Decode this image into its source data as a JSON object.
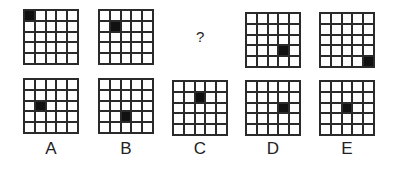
{
  "puzzle": {
    "grid_size": 5,
    "colors": {
      "line": "#2a2a2a",
      "filled": "#111111",
      "empty": "#ffffff"
    },
    "sequence": [
      {
        "id": "seq-1",
        "filled": [
          0,
          0
        ],
        "left": 23,
        "top": 9
      },
      {
        "id": "seq-2",
        "filled": [
          1,
          1
        ],
        "left": 98,
        "top": 9
      },
      {
        "id": "seq-3",
        "question": "?"
      },
      {
        "id": "seq-4",
        "filled": [
          3,
          3
        ],
        "left": 245,
        "top": 12
      },
      {
        "id": "seq-5",
        "filled": [
          4,
          4
        ],
        "left": 319,
        "top": 12
      }
    ],
    "question_mark": "?",
    "options": [
      {
        "label": "A",
        "filled": [
          2,
          1
        ],
        "left": 23,
        "top": 78
      },
      {
        "label": "B",
        "filled": [
          3,
          2
        ],
        "left": 98,
        "top": 78
      },
      {
        "label": "C",
        "filled": [
          1,
          2
        ],
        "left": 172,
        "top": 80
      },
      {
        "label": "D",
        "filled": [
          2,
          3
        ],
        "left": 245,
        "top": 80
      },
      {
        "label": "E",
        "filled": [
          2,
          2
        ],
        "left": 319,
        "top": 80
      }
    ]
  }
}
